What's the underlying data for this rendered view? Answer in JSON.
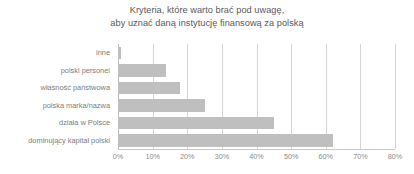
{
  "chart_data": {
    "type": "bar",
    "orientation": "horizontal",
    "title": "Kryteria, które warto brać pod uwagę, aby uznać daną instytucję finansową za polską",
    "title_lines": [
      "Kryteria, które warto brać pod uwagę,",
      "aby uznać daną instytucję finansową za polską"
    ],
    "xlabel": "",
    "ylabel": "",
    "categories": [
      "inne",
      "polski personel",
      "własność państwowa",
      "polska marka/nazwa",
      "działa w Polsce",
      "dominujący kapitał polski"
    ],
    "values": [
      1,
      14,
      18,
      25,
      45,
      62
    ],
    "xlim": [
      0,
      80
    ],
    "xtick_values": [
      0,
      10,
      20,
      30,
      40,
      50,
      60,
      70,
      80
    ],
    "xtick_labels": [
      "0%",
      "10%",
      "20%",
      "30%",
      "40%",
      "50%",
      "60%",
      "70%",
      "80%"
    ],
    "grid": "vertical",
    "legend": null,
    "bar_color": "#bfbfbf",
    "gridline_color": "#d4d4d4",
    "title_color": "#58585a",
    "label_color": "#7d7d7f",
    "background_color": "#ffffff"
  }
}
